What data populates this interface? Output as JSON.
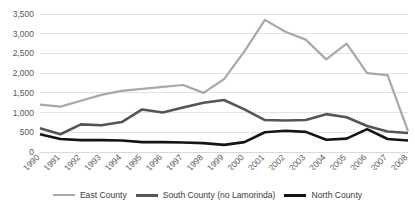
{
  "chart_data": {
    "type": "line",
    "title": "",
    "subtitle": "",
    "xlabel": "",
    "ylabel": "",
    "categories": [
      "1990",
      "1991",
      "1992",
      "1993",
      "1994",
      "1995",
      "1996",
      "1997",
      "1998",
      "1999",
      "2000",
      "2001",
      "2002",
      "2003",
      "2004",
      "2005",
      "2006",
      "2007",
      "2008"
    ],
    "ylim": [
      0,
      3500
    ],
    "yticks": [
      "0",
      "500",
      "1,000",
      "1,500",
      "2,000",
      "2,500",
      "3,000",
      "3,500"
    ],
    "ytick_values": [
      0,
      500,
      1000,
      1500,
      2000,
      2500,
      3000,
      3500
    ],
    "grid": true,
    "legend_position": "bottom",
    "series": [
      {
        "name": "East County",
        "color": "#a8a8a8",
        "width": 2.2,
        "values": [
          1200,
          1150,
          1300,
          1450,
          1550,
          1600,
          1650,
          1700,
          1500,
          1850,
          2550,
          3350,
          3050,
          2850,
          2350,
          2750,
          2000,
          1950,
          530
        ]
      },
      {
        "name": "South County (no Lamorinda)",
        "color": "#555555",
        "width": 2.6,
        "values": [
          600,
          450,
          700,
          680,
          760,
          1080,
          1000,
          1130,
          1250,
          1320,
          1080,
          810,
          800,
          810,
          960,
          880,
          660,
          520,
          480
        ]
      },
      {
        "name": "North County",
        "color": "#141414",
        "width": 2.6,
        "values": [
          450,
          330,
          300,
          300,
          290,
          250,
          250,
          240,
          225,
          180,
          250,
          500,
          540,
          510,
          310,
          340,
          580,
          330,
          290
        ]
      }
    ]
  },
  "legend": {
    "items": [
      {
        "label": "East County",
        "color": "#a8a8a8",
        "thickness": "2px"
      },
      {
        "label": "South County (no Lamorinda)",
        "color": "#555555",
        "thickness": "3px"
      },
      {
        "label": "North County",
        "color": "#141414",
        "thickness": "3px"
      }
    ]
  }
}
